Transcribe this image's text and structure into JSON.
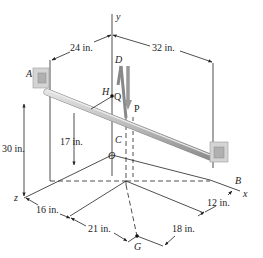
{
  "diagram": {
    "type": "3D statics rod diagram",
    "axes": {
      "x": "x",
      "y": "y",
      "z": "z"
    },
    "points": {
      "A": "A",
      "B": "B",
      "C": "C",
      "D": "D",
      "H": "H",
      "O": "O",
      "G": "G",
      "Q": "Q",
      "P": "P"
    },
    "dimensions": {
      "d24": "24 in.",
      "d32": "32 in.",
      "d30": "30 in.",
      "d17": "17 in.",
      "d16": "16 in.",
      "d21": "21 in.",
      "d18": "18 in.",
      "d12": "12 in."
    },
    "colors": {
      "rod": "#b8b8b8",
      "rod_highlight": "#dedede",
      "bracket": "#c8c8c8",
      "line": "#222222"
    }
  }
}
